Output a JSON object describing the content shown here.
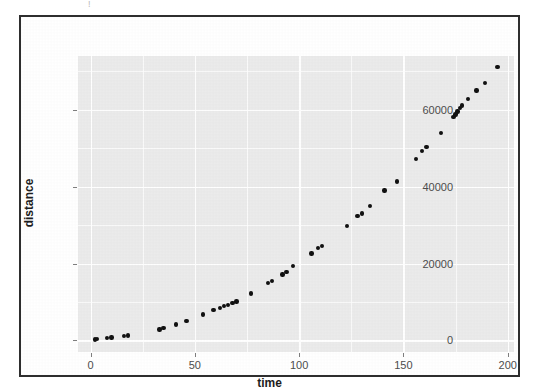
{
  "figure": {
    "background_color": "#ffffff",
    "frame_color": "#2e2e2e",
    "panel_color": "#ebebeb",
    "gridline_color": "#ffffff",
    "point_color": "#111111",
    "scan_artifact": "!"
  },
  "chart_data": {
    "type": "scatter",
    "title": "",
    "xlabel": "time",
    "ylabel": "distance",
    "xlim": [
      -6,
      203
    ],
    "ylim": [
      -3000,
      74000
    ],
    "xticks": [
      0,
      50,
      100,
      150,
      200
    ],
    "xtick_labels": [
      "0",
      "50",
      "100",
      "150",
      "200"
    ],
    "yticks": [
      0,
      20000,
      40000,
      60000
    ],
    "ytick_labels": [
      "0",
      "20000",
      "40000",
      "60000"
    ],
    "x_minor_ticks": [
      25,
      75,
      125,
      175
    ],
    "y_minor_ticks": [
      10000,
      30000,
      50000,
      70000
    ],
    "grid": true,
    "legend": "none",
    "series": [
      {
        "name": "distance vs time",
        "marker": "filled-circle",
        "color": "#111111",
        "points": [
          [
            2,
            300
          ],
          [
            3,
            400
          ],
          [
            8,
            700
          ],
          [
            10,
            800
          ],
          [
            16,
            1100
          ],
          [
            18,
            1300
          ],
          [
            33,
            2900
          ],
          [
            35,
            3300
          ],
          [
            41,
            4200
          ],
          [
            46,
            5000
          ],
          [
            54,
            6800
          ],
          [
            59,
            7900
          ],
          [
            62,
            8500
          ],
          [
            64,
            8900
          ],
          [
            66,
            9300
          ],
          [
            68,
            9700
          ],
          [
            70,
            10100
          ],
          [
            77,
            12200
          ],
          [
            85,
            15000
          ],
          [
            87,
            15500
          ],
          [
            92,
            17200
          ],
          [
            94,
            17800
          ],
          [
            97,
            19400
          ],
          [
            106,
            22600
          ],
          [
            109,
            24100
          ],
          [
            111,
            24500
          ],
          [
            123,
            29700
          ],
          [
            128,
            32400
          ],
          [
            130,
            33000
          ],
          [
            134,
            35000
          ],
          [
            141,
            39000
          ],
          [
            147,
            41400
          ],
          [
            156,
            47200
          ],
          [
            159,
            49300
          ],
          [
            161,
            50300
          ],
          [
            168,
            54000
          ],
          [
            174,
            58200
          ],
          [
            175,
            58800
          ],
          [
            176,
            59600
          ],
          [
            177,
            60400
          ],
          [
            178,
            61100
          ],
          [
            181,
            62800
          ],
          [
            185,
            65000
          ],
          [
            189,
            67000
          ],
          [
            195,
            71200
          ]
        ]
      }
    ]
  }
}
